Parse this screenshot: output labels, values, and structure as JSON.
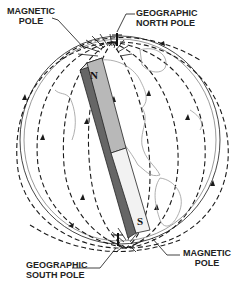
{
  "diagram": {
    "labels": {
      "magnetic_north": [
        "MAGNETIC",
        "POLE"
      ],
      "geographic_north": [
        "GEOGRAPHIC",
        "NORTH POLE"
      ],
      "geographic_south": [
        "GEOGRAPHIC",
        "SOUTH POLE"
      ],
      "magnetic_south": [
        "MAGNETIC",
        "POLE"
      ]
    },
    "magnet": {
      "north_letter": "N",
      "south_letter": "S",
      "north_half_color": "#b8b8b8",
      "south_half_color": "#8a8a8a"
    },
    "line_color": "#1a1a1a",
    "continent_color": "#9a9a9a"
  }
}
